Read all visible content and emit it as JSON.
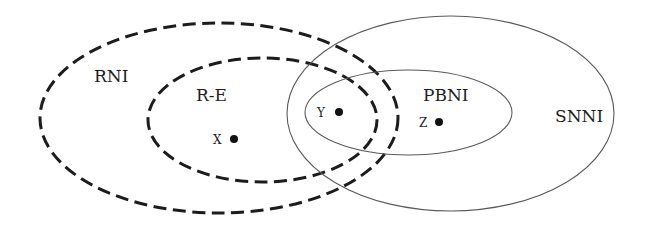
{
  "diagram": {
    "type": "venn",
    "sets": [
      {
        "id": "rni",
        "label": "RNI",
        "border": "dashed"
      },
      {
        "id": "re",
        "label": "R-E",
        "border": "dashed"
      },
      {
        "id": "snni",
        "label": "SNNI",
        "border": "solid"
      },
      {
        "id": "pbni",
        "label": "PBNI",
        "border": "solid"
      }
    ],
    "points": [
      {
        "id": "x",
        "label": "X",
        "in_sets": [
          "RNI",
          "R-E"
        ]
      },
      {
        "id": "y",
        "label": "Y",
        "in_sets": [
          "RNI",
          "R-E",
          "SNNI",
          "PBNI"
        ]
      },
      {
        "id": "z",
        "label": "Z",
        "in_sets": [
          "SNNI",
          "PBNI"
        ]
      }
    ],
    "colors": {
      "dashed_stroke": "#1c1c1c",
      "solid_stroke": "#5a5a5a",
      "text": "#1e1e1e",
      "background": "#ffffff"
    }
  }
}
